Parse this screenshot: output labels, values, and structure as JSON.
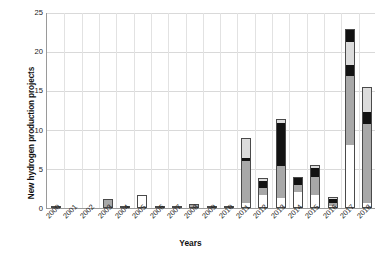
{
  "chart_data": {
    "type": "bar",
    "stacked": true,
    "title": "",
    "xlabel": "Years",
    "ylabel": "New hydrogen production projects capacities (MW of H2)",
    "ylabel_line1": "New hydrogen production projects",
    "ylabel_line2": "capacities (MW of H",
    "ylabel_sub": "2",
    "ylabel_line2_end": ")",
    "ylim": [
      0,
      25
    ],
    "yticks": [
      0,
      5,
      10,
      15,
      20,
      25
    ],
    "ytick_labels": [
      "0",
      "5",
      "10",
      "15",
      "20",
      "25"
    ],
    "grid": "horizontal-and-vertical",
    "legend": "none",
    "categories": [
      "2000",
      "2001",
      "2002",
      "2003",
      "2004",
      "2005",
      "2006",
      "2007",
      "2008",
      "2009",
      "2010",
      "2011",
      "2012",
      "2013",
      "2014",
      "2015",
      "2016",
      "2017",
      "2018"
    ],
    "series": [
      {
        "name": "white",
        "color": "#ffffff",
        "values": [
          0.15,
          0,
          0,
          0.15,
          0.2,
          1.6,
          0.25,
          0.2,
          0.15,
          0.2,
          0.25,
          0.6,
          1.6,
          1.3,
          2.1,
          1.6,
          0.3,
          8.0,
          0.7
        ]
      },
      {
        "name": "gray",
        "color": "#a8a8a8",
        "values": [
          0,
          0,
          0,
          1.0,
          0,
          0,
          0,
          0,
          0.35,
          0,
          0,
          5.4,
          0.9,
          4.1,
          0.9,
          2.3,
          0.35,
          8.9,
          10.0
        ]
      },
      {
        "name": "black",
        "color": "#121212",
        "values": [
          0,
          0,
          0,
          0,
          0,
          0,
          0,
          0,
          0,
          0,
          0,
          0.35,
          0.9,
          5.4,
          1.0,
          1.2,
          0.5,
          1.3,
          1.6
        ]
      },
      {
        "name": "light-gray",
        "color": "#dcdcdc",
        "values": [
          0,
          0,
          0,
          0,
          0,
          0,
          0,
          0,
          0,
          0,
          0,
          2.6,
          0.4,
          0.6,
          0,
          0.4,
          0.2,
          3.0,
          3.2
        ]
      },
      {
        "name": "black-top",
        "color": "#121212",
        "values": [
          0,
          0,
          0,
          0,
          0,
          0,
          0,
          0,
          0,
          0,
          0,
          0,
          0,
          0,
          0,
          0,
          0,
          1.6,
          0
        ]
      }
    ],
    "totals": [
      0.15,
      0,
      0,
      1.15,
      0.2,
      1.6,
      0.25,
      0.2,
      0.5,
      0.2,
      0.25,
      8.95,
      3.8,
      11.4,
      4.0,
      5.5,
      1.35,
      22.8,
      15.5
    ]
  }
}
